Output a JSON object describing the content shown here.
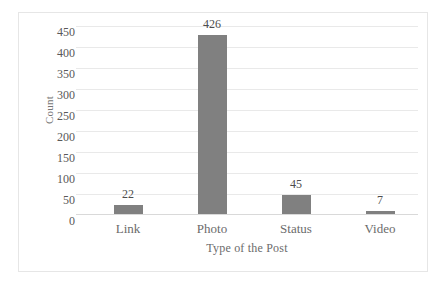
{
  "chart_data": {
    "type": "bar",
    "title": "",
    "subtitle": "",
    "xlabel": "Type of the Post",
    "ylabel": "Count",
    "categories": [
      "Link",
      "Photo",
      "Status",
      "Video"
    ],
    "values": [
      22,
      426,
      45,
      7
    ],
    "data_labels": [
      "22",
      "426",
      "45",
      "7"
    ],
    "ylim": [
      0,
      450
    ],
    "ytick_labels": [
      "450",
      "400",
      "350",
      "300",
      "250",
      "200",
      "150",
      "100",
      "50",
      "0"
    ],
    "ytick_values": [
      450,
      400,
      350,
      300,
      250,
      200,
      150,
      100,
      50,
      0
    ],
    "grid": "horizontal",
    "legend": "none",
    "bar_color": "#808080",
    "gridline_color": "#e9e9e9",
    "axis_text_color": "#6b6b6b",
    "background_color": "#ffffff",
    "frame_color": "#e6e6e6"
  }
}
